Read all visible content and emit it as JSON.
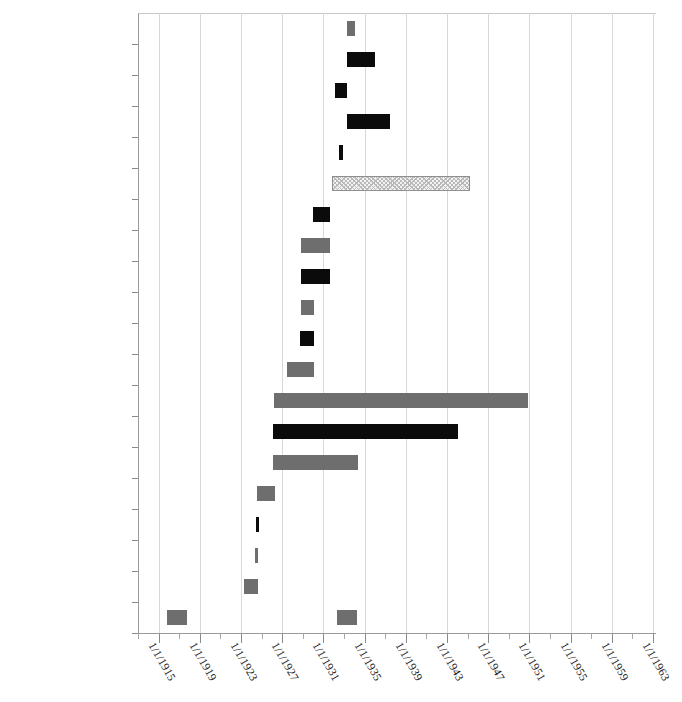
{
  "chart_data": {
    "type": "bar",
    "orientation": "horizontal-gantt",
    "title": "",
    "subtitle": "",
    "xlabel": "",
    "ylabel": "",
    "grid": true,
    "legend": null,
    "xlim": [
      "1/1/1913",
      "1/1/1963"
    ],
    "x_major_tick_labels": [
      "1/1/1915",
      "1/1/1919",
      "1/1/1923",
      "1/1/1927",
      "1/1/1931",
      "1/1/1935",
      "1/1/1939",
      "1/1/1943",
      "1/1/1947",
      "1/1/1951",
      "1/1/1955",
      "1/1/1959",
      "1/1/1963"
    ],
    "x_major_tick_years": [
      1915,
      1919,
      1923,
      1927,
      1931,
      1935,
      1939,
      1943,
      1947,
      1951,
      1955,
      1959,
      1963
    ],
    "x_minor_tick_years": [
      1913,
      1917,
      1921,
      1925,
      1929,
      1933,
      1937,
      1941,
      1945,
      1949,
      1953,
      1957,
      1961
    ],
    "x_tick_label_rotation_deg": 60,
    "categories": [
      "Marian Clarke",
      "Isabella Greenway",
      "Kathryn McCarthy",
      "Virginia Jenckes",
      "Willa Eslick",
      "Hattie Caraway",
      "Effiegene Wingo",
      "Ruth Pratt",
      "Ruth Owen",
      "Ruth McCormick",
      "Pearl Oldfield",
      "Katherine Langley",
      "Edith Nourse Rogers",
      "Mary Norton",
      "Florence Kahn",
      "Mae Ella Nolan",
      "Rebecca Felton",
      "Winnifred Huck",
      "Alice Robertson",
      "Jeannette Rankin"
    ],
    "colors": {
      "dark": "#0b0b0b",
      "gray": "#6e6e6e",
      "hatched_fill": "#f2f2f2",
      "hatched_stroke": "#8f8f8f",
      "gridline": "#d8d8d8",
      "axis": "#9a9a9a"
    },
    "bars": [
      {
        "category": "Marian Clarke",
        "start_year": 1933.3,
        "end_year": 1934.1,
        "style": "gray"
      },
      {
        "category": "Isabella Greenway",
        "start_year": 1933.3,
        "end_year": 1936.0,
        "style": "dark"
      },
      {
        "category": "Kathryn McCarthy",
        "start_year": 1932.1,
        "end_year": 1933.3,
        "style": "dark"
      },
      {
        "category": "Virginia Jenckes",
        "start_year": 1933.3,
        "end_year": 1937.5,
        "style": "dark"
      },
      {
        "category": "Willa Eslick",
        "start_year": 1932.5,
        "end_year": 1932.9,
        "style": "dark"
      },
      {
        "category": "Hattie Caraway",
        "start_year": 1931.8,
        "end_year": 1945.2,
        "style": "hatched"
      },
      {
        "category": "Effiegene Wingo",
        "start_year": 1930.0,
        "end_year": 1931.6,
        "style": "dark"
      },
      {
        "category": "Ruth Pratt",
        "start_year": 1928.8,
        "end_year": 1931.6,
        "style": "gray"
      },
      {
        "category": "Ruth Owen",
        "start_year": 1928.8,
        "end_year": 1931.6,
        "style": "dark"
      },
      {
        "category": "Ruth McCormick",
        "start_year": 1928.8,
        "end_year": 1930.1,
        "style": "gray"
      },
      {
        "category": "Pearl Oldfield",
        "start_year": 1928.7,
        "end_year": 1930.1,
        "style": "dark"
      },
      {
        "category": "Katherine Langley",
        "start_year": 1927.5,
        "end_year": 1930.1,
        "style": "gray"
      },
      {
        "category": "Edith Nourse Rogers",
        "start_year": 1926.2,
        "end_year": 1950.9,
        "style": "gray"
      },
      {
        "category": "Mary Norton",
        "start_year": 1926.1,
        "end_year": 1944.1,
        "style": "dark"
      },
      {
        "category": "Florence Kahn",
        "start_year": 1926.1,
        "end_year": 1934.4,
        "style": "gray"
      },
      {
        "category": "Mae Ella Nolan",
        "start_year": 1924.6,
        "end_year": 1926.3,
        "style": "gray"
      },
      {
        "category": "Rebecca Felton",
        "start_year": 1924.5,
        "end_year": 1924.7,
        "style": "dark"
      },
      {
        "category": "Winnifred Huck",
        "start_year": 1924.4,
        "end_year": 1924.6,
        "style": "gray"
      },
      {
        "category": "Alice Robertson",
        "start_year": 1923.3,
        "end_year": 1924.7,
        "style": "gray"
      },
      {
        "category": "Jeannette Rankin",
        "start_year": 1915.8,
        "end_year": 1917.8,
        "style": "gray"
      },
      {
        "category": "Jeannette Rankin",
        "start_year": 1932.3,
        "end_year": 1934.3,
        "style": "gray"
      }
    ]
  }
}
